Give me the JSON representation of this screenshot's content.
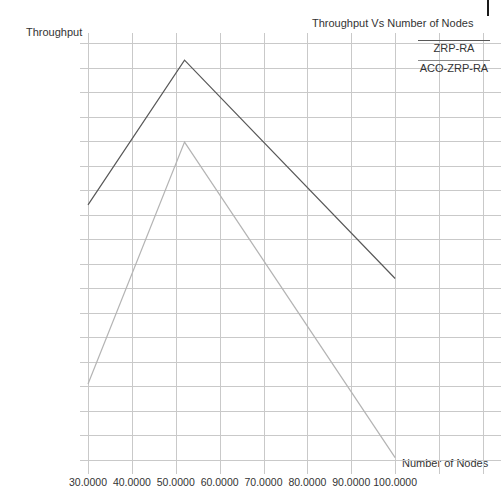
{
  "chart_data": {
    "type": "line",
    "title": "Throughput Vs Number of Nodes",
    "xlabel": "Number of Nodes",
    "ylabel": "Throughput",
    "grid": true,
    "legend_position": "top-right",
    "xlim": [
      30,
      110
    ],
    "ylim": [
      45,
      130
    ],
    "xticks": [
      "30.0000",
      "40.0000",
      "50.0000",
      "60.0000",
      "70.0000",
      "80.0000",
      "90.0000",
      "100.0000"
    ],
    "xtick_values": [
      30,
      40,
      50,
      60,
      70,
      80,
      90,
      100
    ],
    "yticks": [
      "30.0000",
      "25.0000",
      "20.0000",
      "15.0000",
      "10.0000",
      "05.0000",
      "00.0000",
      "95.0000",
      "90.0000",
      "85.0000",
      "80.0000",
      "75.0000",
      "70.0000",
      "65.0000",
      "60.0000",
      "55.0000",
      "50.0000",
      "45.0000"
    ],
    "ytick_values": [
      130,
      125,
      120,
      115,
      110,
      105,
      100,
      95,
      90,
      85,
      80,
      75,
      70,
      65,
      60,
      55,
      50,
      45
    ],
    "series": [
      {
        "name": "ZRP-RA",
        "color": "#585858",
        "x": [
          30,
          52,
          100
        ],
        "values": [
          97.0,
          126.5,
          82.0
        ]
      },
      {
        "name": "ACO-ZRP-RA",
        "color": "#b4b4b4",
        "x": [
          30,
          52,
          100
        ],
        "values": [
          60.5,
          109.8,
          45.5
        ]
      }
    ]
  },
  "legend": {
    "entries": [
      {
        "label": "ZRP-RA",
        "color": "#585858"
      },
      {
        "label": "ACO-ZRP-RA",
        "color": "#8a8a8a"
      }
    ]
  }
}
